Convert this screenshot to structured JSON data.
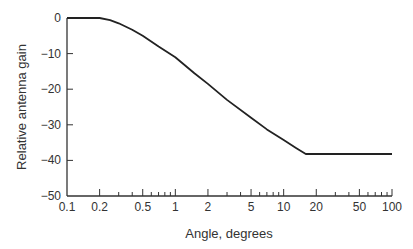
{
  "chart_data": {
    "type": "line",
    "title": "",
    "xlabel": "Angle, degrees",
    "ylabel": "Relative antenna gain",
    "xscale": "log",
    "xlim": [
      0.1,
      100
    ],
    "ylim": [
      -50,
      0
    ],
    "grid": false,
    "legend": null,
    "x_tick_labels": [
      "0.1",
      "0.2",
      "0.5",
      "1",
      "2",
      "5",
      "10",
      "20",
      "50",
      "100"
    ],
    "x_tick_values": [
      0.1,
      0.2,
      0.5,
      1,
      2,
      5,
      10,
      20,
      50,
      100
    ],
    "y_tick_labels": [
      "0",
      "−10",
      "−20",
      "−30",
      "−40",
      "−50"
    ],
    "y_tick_values": [
      0,
      -10,
      -20,
      -30,
      -40,
      -50
    ],
    "series": [
      {
        "name": "Relative antenna gain",
        "color": "#222222",
        "x": [
          0.1,
          0.15,
          0.2,
          0.25,
          0.3,
          0.4,
          0.5,
          0.7,
          1,
          1.5,
          2,
          3,
          5,
          7,
          10,
          13,
          16,
          20,
          50,
          100
        ],
        "y": [
          0,
          0,
          0,
          -0.6,
          -1.5,
          -3.3,
          -5,
          -8,
          -11,
          -15.5,
          -18.5,
          -23,
          -28,
          -31.3,
          -34.3,
          -36.5,
          -38.2,
          -38.2,
          -38.2,
          -38.2
        ]
      }
    ]
  }
}
